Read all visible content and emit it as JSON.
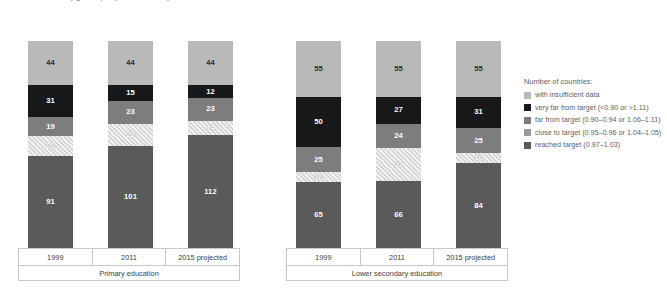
{
  "title": "Number of countries by gender parity index of the adjusted net enrolment rate, 1999, 2011 and 2015",
  "legend": {
    "heading": "Number of countries:",
    "items": [
      {
        "key": "insufficient",
        "label": "with insufficient data",
        "color": "#b9b9b9"
      },
      {
        "key": "veryfar",
        "label": "very far from target (<0.90 or >1.11)",
        "color": "#16181a"
      },
      {
        "key": "far",
        "label": "far from target (0.90–0.94 or 1.06–1.11)",
        "color": "#7d7d7d"
      },
      {
        "key": "close",
        "label": "close to target (0.95–0.96 or 1.04–1.05)",
        "color": "#9a9a9a"
      },
      {
        "key": "reached",
        "label": "reached target (0.97–1.03)",
        "color": "#5a5a5a"
      }
    ]
  },
  "groups": [
    {
      "label": "Primary education",
      "years": [
        "1999",
        "2011",
        "2015 projected"
      ]
    },
    {
      "label": "Lower secondary education",
      "years": [
        "1999",
        "2011",
        "2015 projected"
      ]
    }
  ],
  "bars": [
    {
      "group": 0,
      "year": "1999",
      "insufficient": 44,
      "veryfar": 31,
      "far": 19,
      "close": 20,
      "reached": 91
    },
    {
      "group": 0,
      "year": "2011",
      "insufficient": 44,
      "veryfar": 15,
      "far": 23,
      "close": 22,
      "reached": 101
    },
    {
      "group": 0,
      "year": "2015 projected",
      "insufficient": 44,
      "veryfar": 12,
      "far": 23,
      "close": 14,
      "reached": 112
    },
    {
      "group": 1,
      "year": "1999",
      "insufficient": 55,
      "veryfar": 50,
      "far": 25,
      "close": 10,
      "reached": 65
    },
    {
      "group": 1,
      "year": "2011",
      "insufficient": 55,
      "veryfar": 27,
      "far": 24,
      "close": 33,
      "reached": 66
    },
    {
      "group": 1,
      "year": "2015 projected",
      "insufficient": 55,
      "veryfar": 31,
      "far": 25,
      "close": 10,
      "reached": 84
    }
  ],
  "chart_data": {
    "type": "bar",
    "subtype": "stacked-vertical",
    "title": "Number of countries by gender parity index of the adjusted net enrolment rate, 1999, 2011 and 2015",
    "xlabel": "",
    "ylabel": "Number of countries",
    "grid": false,
    "legend_position": "right",
    "legend_title": "Number of countries:",
    "group_labels": [
      "Primary education",
      "Lower secondary education"
    ],
    "categories": [
      "Primary education – 1999",
      "Primary education – 2011",
      "Primary education – 2015 projected",
      "Lower secondary education – 1999",
      "Lower secondary education – 2011",
      "Lower secondary education – 2015 projected"
    ],
    "series": [
      {
        "name": "reached target (0.97–1.03)",
        "color": "#5a5a5a",
        "values": [
          91,
          101,
          112,
          65,
          66,
          84
        ]
      },
      {
        "name": "close to target (0.95–0.96 or 1.04–1.05)",
        "color": "#9a9a9a",
        "pattern": "diagonal-hatch",
        "values": [
          20,
          22,
          14,
          10,
          33,
          10
        ]
      },
      {
        "name": "far from target (0.90–0.94 or 1.06–1.11)",
        "color": "#7d7d7d",
        "values": [
          19,
          23,
          23,
          25,
          24,
          25
        ]
      },
      {
        "name": "very far from target (<0.90 or >1.11)",
        "color": "#16181a",
        "values": [
          31,
          15,
          12,
          50,
          27,
          31
        ]
      },
      {
        "name": "with insufficient data",
        "color": "#b9b9b9",
        "values": [
          44,
          44,
          44,
          55,
          55,
          55
        ]
      }
    ],
    "totals": [
      205,
      205,
      205,
      205,
      205,
      205
    ],
    "ylim": [
      0,
      205
    ],
    "stack_order_bottom_to_top": [
      "reached target (0.97–1.03)",
      "close to target (0.95–0.96 or 1.04–1.05)",
      "far from target (0.90–0.94 or 1.06–1.11)",
      "very far from target (<0.90 or >1.11)",
      "with insufficient data"
    ]
  }
}
